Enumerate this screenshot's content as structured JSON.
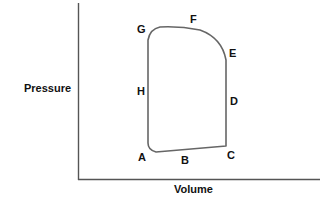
{
  "diagram": {
    "type": "pressure-volume cycle",
    "axes": {
      "y_label": "Pressure",
      "x_label": "Volume"
    },
    "points": [
      {
        "id": "A",
        "label": "A"
      },
      {
        "id": "B",
        "label": "B"
      },
      {
        "id": "C",
        "label": "C"
      },
      {
        "id": "D",
        "label": "D"
      },
      {
        "id": "E",
        "label": "E"
      },
      {
        "id": "F",
        "label": "F"
      },
      {
        "id": "G",
        "label": "G"
      },
      {
        "id": "H",
        "label": "H"
      }
    ],
    "colors": {
      "axis": "#555555",
      "curve": "#666666",
      "text": "#111111"
    }
  }
}
